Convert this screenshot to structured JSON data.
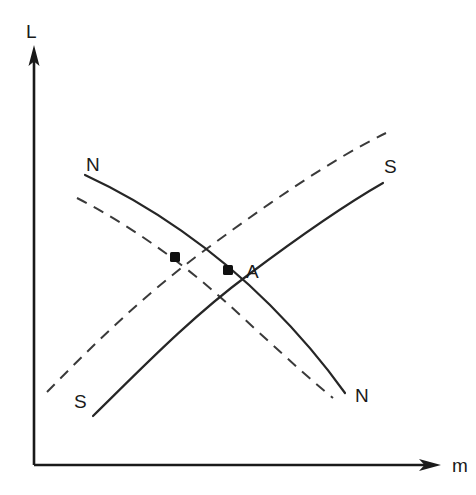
{
  "figure": {
    "background_color": "#ffffff",
    "line_color": "#1a1a1a",
    "width": 476,
    "height": 495
  },
  "axes": {
    "y_label": "L",
    "x_label": "m",
    "origin": {
      "x": 34,
      "y": 465
    },
    "y_axis_top": {
      "x": 34,
      "y": 46
    },
    "x_axis_right": {
      "x": 440,
      "y": 465
    },
    "has_arrowheads": true,
    "ticks": [],
    "tick_labels": []
  },
  "curve_labels": {
    "n_top": "N",
    "s_top": "S",
    "s_bottom": "S",
    "n_bottom": "N"
  },
  "points": {
    "labeled": [
      {
        "label": "A",
        "x": 228,
        "y": 270
      }
    ],
    "unlabeled": [
      {
        "label": "",
        "x": 175,
        "y": 257
      }
    ]
  },
  "chart_data": {
    "type": "line",
    "title": "",
    "xlabel": "m",
    "ylabel": "L",
    "grid": false,
    "legend": "none",
    "xlim": [
      34,
      440
    ],
    "ylim": [
      465,
      46
    ],
    "series": [
      {
        "name": "N",
        "style": "solid",
        "description": "downward sloping demand curve N, solid",
        "path": "M 85,175 C 150,205 215,250 270,305 C 305,340 330,372 345,393"
      },
      {
        "name": "S",
        "style": "solid",
        "description": "upward sloping supply curve S, solid",
        "path": "M 93,416 C 140,370 190,318 248,275 C 300,236 348,203 383,183"
      },
      {
        "name": "N'",
        "style": "dashed",
        "description": "shifted downward sloping curve N, dashed",
        "path": "M 77,198 C 135,228 190,268 240,315 C 280,352 312,381 333,398"
      },
      {
        "name": "S'",
        "style": "dashed",
        "description": "shifted upward sloping curve S, dashed",
        "path": "M 47,392 C 95,343 145,294 205,250 C 262,208 330,160 386,133"
      }
    ]
  }
}
